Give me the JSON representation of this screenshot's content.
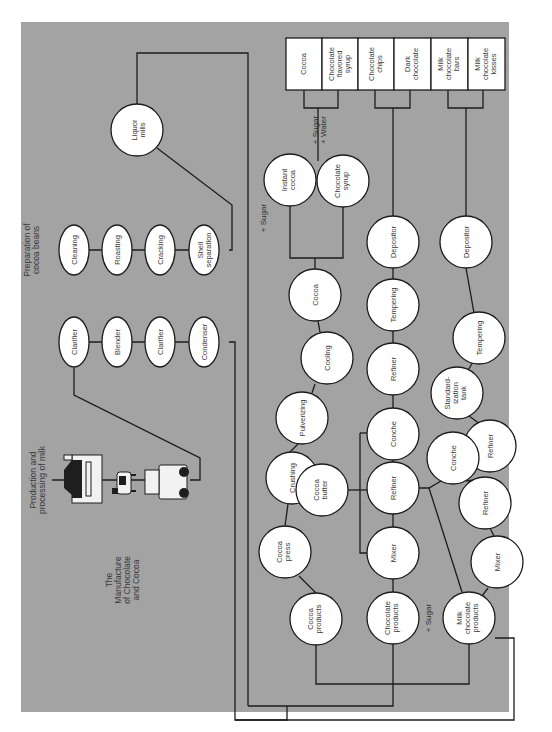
{
  "title_lines": [
    "The",
    "Manufacture",
    "of Chocolate",
    "and Cocoa"
  ],
  "orientation": "rotated 90° counter-clockwise (text reads bottom-to-top)",
  "colors": {
    "panel": "#a3a3a3",
    "node_fill": "#ffffff",
    "line": "#1c1c1c",
    "page": "#ffffff"
  },
  "sections": {
    "milk": {
      "heading_lines": [
        "Production and",
        "processing of milk"
      ],
      "illustrations": [
        "dairy-barn-icon",
        "cow-icon",
        "milk-truck-icon"
      ],
      "steps": [
        {
          "id": "clarifier-1",
          "lines": [
            "Clarifier"
          ]
        },
        {
          "id": "blender",
          "lines": [
            "Blender"
          ]
        },
        {
          "id": "clarifier-2",
          "lines": [
            "Clarifier"
          ]
        },
        {
          "id": "condenser",
          "lines": [
            "Condenser"
          ]
        }
      ]
    },
    "beans": {
      "heading_lines": [
        "Preparation of",
        "cocoa beans"
      ],
      "steps": [
        {
          "id": "cleaning",
          "lines": [
            "Cleaning"
          ]
        },
        {
          "id": "roasting",
          "lines": [
            "Roasting"
          ]
        },
        {
          "id": "cracking",
          "lines": [
            "Cracking"
          ]
        },
        {
          "id": "shell-separation",
          "lines": [
            "Shell",
            "separation"
          ]
        }
      ],
      "liquor_mills": {
        "lines": [
          "Liquor",
          "mills"
        ]
      }
    },
    "cocoa_branch": {
      "nodes": [
        {
          "id": "cocoa-products",
          "lines": [
            "Cocoa",
            "products"
          ]
        },
        {
          "id": "cocoa-press",
          "lines": [
            "Cocoa",
            "press"
          ]
        },
        {
          "id": "cocoa-butter",
          "lines": [
            "Cocoa",
            "butter"
          ]
        },
        {
          "id": "crushing",
          "lines": [
            "Crushing"
          ]
        },
        {
          "id": "pulverizing",
          "lines": [
            "Pulverizing"
          ]
        },
        {
          "id": "cooling",
          "lines": [
            "Cooling"
          ]
        },
        {
          "id": "cocoa",
          "lines": [
            "Cocoa"
          ]
        },
        {
          "id": "instant-cocoa",
          "lines": [
            "Instant",
            "cocoa"
          ]
        },
        {
          "id": "chocolate-syrup",
          "lines": [
            "Chocolate",
            "syrup"
          ]
        }
      ],
      "notes": {
        "sugar": "+ Sugar",
        "sugar_water": [
          "+ Sugar",
          "+ Water"
        ]
      }
    },
    "chocolate_branch": {
      "nodes": [
        {
          "id": "chocolate-products",
          "lines": [
            "Chocolate",
            "products"
          ]
        },
        {
          "id": "mixer",
          "lines": [
            "Mixer"
          ]
        },
        {
          "id": "refiner-1",
          "lines": [
            "Refiner"
          ]
        },
        {
          "id": "conche",
          "lines": [
            "Conche"
          ]
        },
        {
          "id": "refiner-2",
          "lines": [
            "Refiner"
          ]
        },
        {
          "id": "tempering",
          "lines": [
            "Tempering"
          ]
        },
        {
          "id": "depositor",
          "lines": [
            "Depositor"
          ]
        }
      ],
      "notes": {
        "sugar": "+ Sugar"
      }
    },
    "milk_chocolate_branch": {
      "nodes": [
        {
          "id": "milk-chocolate-products",
          "lines": [
            "Milk",
            "chocolate",
            "products"
          ]
        },
        {
          "id": "mixer",
          "lines": [
            "Mixer"
          ]
        },
        {
          "id": "refiner-1",
          "lines": [
            "Refiner"
          ]
        },
        {
          "id": "conche",
          "lines": [
            "Conche"
          ]
        },
        {
          "id": "refiner-2",
          "lines": [
            "Refiner"
          ]
        },
        {
          "id": "standardization-tank",
          "lines": [
            "Standard-",
            "ization",
            "tank"
          ]
        },
        {
          "id": "tempering",
          "lines": [
            "Tempering"
          ]
        },
        {
          "id": "depositor",
          "lines": [
            "Depositor"
          ]
        }
      ]
    },
    "final_products": [
      {
        "id": "cocoa",
        "lines": [
          "Cocoa"
        ]
      },
      {
        "id": "chocolate-flavored-syrup",
        "lines": [
          "Chocolate",
          "flavored",
          "syrup"
        ]
      },
      {
        "id": "chocolate-chips",
        "lines": [
          "Chocolate",
          "chips"
        ]
      },
      {
        "id": "dark-chocolate",
        "lines": [
          "Dark",
          "chocolate"
        ]
      },
      {
        "id": "milk-chocolate-bars",
        "lines": [
          "Milk",
          "chocolate",
          "bars"
        ]
      },
      {
        "id": "milk-chocolate-kisses",
        "lines": [
          "Milk",
          "chocolate",
          "kisses"
        ]
      }
    ]
  }
}
